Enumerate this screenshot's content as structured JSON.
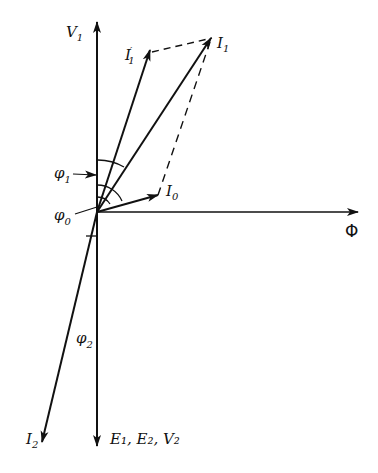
{
  "diagram": {
    "type": "phasor-diagram",
    "labels": {
      "V1": {
        "main": "V",
        "sub": "1"
      },
      "I1prime": {
        "main": "I",
        "sub": "1",
        "sup": "′"
      },
      "I1": {
        "main": "I",
        "sub": "1"
      },
      "phi1": {
        "main": "φ",
        "sub": "1"
      },
      "phi0": {
        "main": "φ",
        "sub": "0"
      },
      "phi2": {
        "main": "φ",
        "sub": "2"
      },
      "I0": {
        "main": "I",
        "sub": "0"
      },
      "Phi": "Φ",
      "I2": {
        "main": "I",
        "sub": "2"
      },
      "E1E2V2": "E₁, E₂, V₂"
    },
    "phasors": [
      {
        "name": "V1",
        "direction": "up"
      },
      {
        "name": "E1, E2, V2",
        "direction": "down"
      },
      {
        "name": "Φ",
        "direction": "right"
      },
      {
        "name": "I1'",
        "direction": "up-right"
      },
      {
        "name": "I1",
        "direction": "up-right"
      },
      {
        "name": "I0",
        "direction": "slightly-up-right"
      },
      {
        "name": "I2",
        "direction": "down-left"
      }
    ],
    "colors": {
      "ink": "#111111",
      "background": "#ffffff"
    }
  }
}
